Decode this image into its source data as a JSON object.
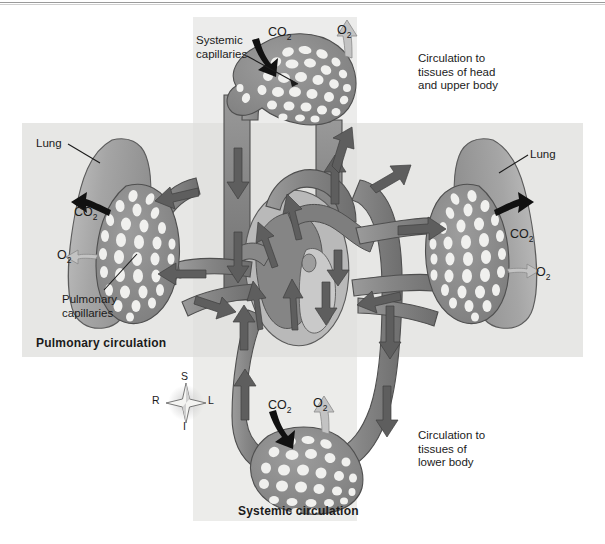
{
  "figure": {
    "type": "anatomical-diagram"
  },
  "panels": {
    "vertical_label": "systemic-circulation-column",
    "horizontal_label": "pulmonary-circulation-row"
  },
  "labels": {
    "systemic_capillaries": "Systemic\ncapillaries",
    "pulmonary_capillaries": "Pulmonary\ncapillaries",
    "lung_left": "Lung",
    "lung_right": "Lung",
    "circulation_head": "Circulation to\ntissues of head\nand upper body",
    "circulation_lower": "Circulation to\ntissues of\nlower body",
    "pulmonary_circulation": "Pulmonary circulation",
    "systemic_circulation": "Systemic circulation"
  },
  "gases": {
    "co2": "CO",
    "co2_sub": "2",
    "o2": "O",
    "o2_sub": "2",
    "top_co2": "CO",
    "top_o2": "O",
    "left_co2": "CO",
    "left_o2": "O",
    "right_co2": "CO",
    "right_o2": "O",
    "bottom_co2": "CO",
    "bottom_o2": "O"
  },
  "compass": {
    "superior": "S",
    "inferior": "I",
    "right": "R",
    "left": "L"
  },
  "colors": {
    "panel_light": "#ececeb",
    "panel_mid": "#e7e7e5",
    "panel_overlap": "#e2e2e0",
    "vessel": "#8a8a8a",
    "vessel_dark": "#6f6f6f",
    "vessel_light": "#b5b5b5",
    "lung": "#a9a9a9",
    "capillary_fill": "#f2f2f0",
    "arrow_flow": "#5e5e5e",
    "arrow_gas_dark": "#141414",
    "arrow_gas_light": "#bdbdbd",
    "text": "#1b1b1b",
    "rule": "#9a9a9a"
  }
}
